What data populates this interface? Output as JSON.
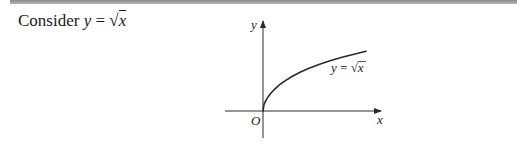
{
  "prompt": {
    "prefix": "Consider ",
    "variable": "y",
    "equals": " = ",
    "radical": "√",
    "radicand": "x"
  },
  "diagram": {
    "axis_x_label": "x",
    "axis_y_label": "y",
    "origin_label": "O",
    "curve_label_lhs": "y",
    "curve_label_eq": " = ",
    "curve_label_radical": "√",
    "curve_label_radicand": "x",
    "function": "y = sqrt(x)",
    "colors": {
      "axes": "#2a2a2a",
      "curve": "#2a2a2a",
      "top_rule": "#9a9a9a"
    }
  }
}
